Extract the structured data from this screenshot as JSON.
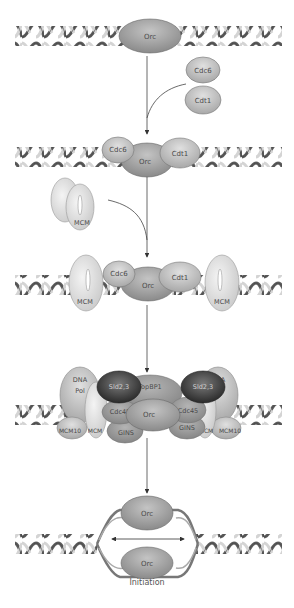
{
  "diagram": {
    "colors": {
      "dna_dark": "#5a5a5a",
      "dna_light": "#d8d8d8",
      "orc": "#9e9e9e",
      "cdc6_cdt1": "#b8b8b8",
      "mcm": "#e2e2e2",
      "sld": "#3c3c3c",
      "topbp1": "#a8a8a8",
      "cdc45_gins": "#9a9a9a",
      "dna_pol": "#d0d0d0",
      "arrow": "#333333"
    },
    "steps": [
      {
        "name": "step1",
        "labels": {
          "orc": "Orc",
          "free1": "Cdc6",
          "free2": "Cdt1"
        }
      },
      {
        "name": "step2",
        "labels": {
          "cdc6": "Cdc6",
          "orc": "Orc",
          "cdt1": "Cdt1",
          "free_mcm": "MCM"
        }
      },
      {
        "name": "step3",
        "labels": {
          "mcm_left": "MCM",
          "cdc6": "Cdc6",
          "orc": "Orc",
          "cdt1": "Cdt1",
          "mcm_right": "MCM"
        }
      },
      {
        "name": "step4",
        "labels": {
          "dna_pol_left": "DNA Pol",
          "dna_pol_left_1": "DNA",
          "dna_pol_left_2": "Pol",
          "sld_left": "Sld2,3",
          "topbp1": "TopBP1",
          "sld_right": "Sld2,3",
          "dna_pol_right_1": "DNA",
          "dna_pol_right_2": "Pol",
          "cdc45_left": "Cdc45",
          "orc": "Orc",
          "cdc45_right": "Cdc45",
          "mcm10_left": "MCM10",
          "mcm_left": "MCM",
          "gins_left": "GINS",
          "gins_right": "GINS",
          "mcm_right": "MCM",
          "mcm10_right": "MCM10"
        }
      },
      {
        "name": "step5",
        "labels": {
          "orc_top": "Orc",
          "orc_bottom": "Orc",
          "caption": "Initiation"
        }
      }
    ]
  }
}
